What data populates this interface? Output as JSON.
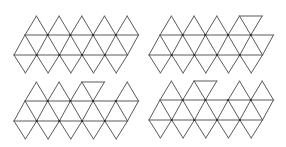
{
  "diagram": {
    "title": "",
    "colors": {
      "background": "#ffffff",
      "edge": "#5a5a5a",
      "vertex": "#2a2a2a"
    },
    "geometry": {
      "side": 22.7,
      "rows_y": {
        "top": 16,
        "upper": 35,
        "middle": 55,
        "bottom": 73
      },
      "upper_x0": 25,
      "middle_x0": 14,
      "top_apex_x0": 36.4,
      "bottom_point_x0": 25.4,
      "strip_triangles": 10,
      "columns": 5
    },
    "nets": [
      {
        "name": "net-top-left",
        "offset": [
          0,
          0
        ],
        "top_caps": [
          0,
          1,
          2,
          3,
          4
        ],
        "flipped_cap_after": null
      },
      {
        "name": "net-top-right",
        "offset": [
          135,
          0
        ],
        "top_caps": [
          0,
          1,
          2,
          3
        ],
        "flipped_cap_after": 3
      },
      {
        "name": "net-bottom-left",
        "offset": [
          0,
          66
        ],
        "top_caps": [
          0,
          1,
          2,
          4
        ],
        "flipped_cap_after": 2
      },
      {
        "name": "net-bottom-right",
        "offset": [
          135,
          65
        ],
        "top_caps": [
          0,
          1,
          3,
          4
        ],
        "flipped_cap_after": 1
      }
    ]
  }
}
